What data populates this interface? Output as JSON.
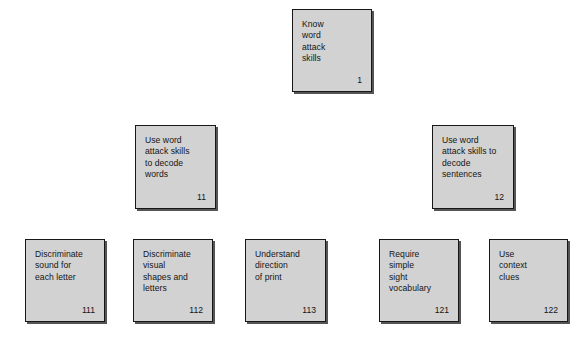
{
  "diagram": {
    "type": "hierarchical-task-analysis",
    "canvas": {
      "width": 577,
      "height": 347,
      "background": "#ffffff"
    },
    "style": {
      "box_fill": "#d2d2d2",
      "box_border": "#171717",
      "text_color": "#151515",
      "shadow": "#555555"
    },
    "levels": [
      {
        "name": "level-1",
        "boxes": [
          "goal"
        ]
      },
      {
        "name": "level-2",
        "boxes": [
          "subskill-11",
          "subskill-12"
        ]
      },
      {
        "name": "level-3",
        "boxes": [
          "subskill-111",
          "subskill-112",
          "subskill-113",
          "subskill-121",
          "subskill-122"
        ]
      }
    ],
    "boxes": [
      {
        "id": "goal",
        "label": "Know\nword\nattack\nskills",
        "number": "1",
        "x": 292,
        "y": 9,
        "width": 80,
        "height": 83
      },
      {
        "id": "subskill-11",
        "label": "Use word\nattack skills\nto decode\nwords",
        "number": "11",
        "x": 135,
        "y": 125,
        "width": 81,
        "height": 84
      },
      {
        "id": "subskill-12",
        "label": "Use word\nattack skills to\ndecode\nsentences",
        "number": "12",
        "x": 432,
        "y": 125,
        "width": 82,
        "height": 84
      },
      {
        "id": "subskill-111",
        "label": "Discriminate\nsound for\neach letter",
        "number": "111",
        "x": 25,
        "y": 239,
        "width": 80,
        "height": 83
      },
      {
        "id": "subskill-112",
        "label": "Discriminate\nvisual\nshapes and\nletters",
        "number": "112",
        "x": 133,
        "y": 239,
        "width": 80,
        "height": 83
      },
      {
        "id": "subskill-113",
        "label": "Understand\ndirection\nof print",
        "number": "113",
        "x": 245,
        "y": 239,
        "width": 81,
        "height": 83
      },
      {
        "id": "subskill-121",
        "label": "Require\nsimple\nsight\nvocabulary",
        "number": "121",
        "x": 379,
        "y": 239,
        "width": 80,
        "height": 83
      },
      {
        "id": "subskill-122",
        "label": "Use\ncontext\nclues",
        "number": "122",
        "x": 489,
        "y": 239,
        "width": 79,
        "height": 83
      }
    ]
  }
}
